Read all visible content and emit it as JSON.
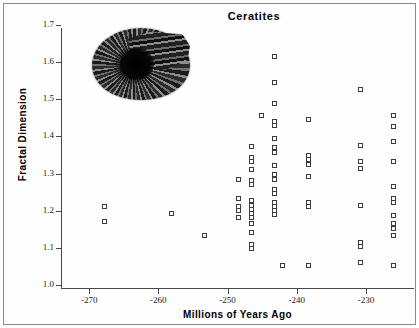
{
  "chart_data": {
    "type": "scatter",
    "title": "Ceratites",
    "xlabel": "Millions of Years Ago",
    "ylabel": "Fractal Dimension",
    "xlim": [
      -274.5,
      -223.5
    ],
    "ylim": [
      1.0,
      1.7
    ],
    "xticks": [
      -270,
      -260,
      -250,
      -240,
      -230
    ],
    "xtick_labels": [
      "-270",
      "-260",
      "-250",
      "-240",
      "-230"
    ],
    "yticks": [
      1.0,
      1.1,
      1.2,
      1.3,
      1.4,
      1.5,
      1.6,
      1.7
    ],
    "ytick_labels": [
      "1.0",
      "1.1",
      "1.2",
      "1.3",
      "1.4",
      "1.5",
      "1.6",
      "1.7"
    ],
    "grid": false,
    "legend": null,
    "marker": "open-square",
    "marker_color": "#3b3b3b",
    "series_name": "Ceratites specimens",
    "points": [
      {
        "x": -267.7,
        "y": 1.211
      },
      {
        "x": -267.7,
        "y": 1.17
      },
      {
        "x": -258.0,
        "y": 1.192
      },
      {
        "x": -253.3,
        "y": 1.131
      },
      {
        "x": -248.3,
        "y": 1.283
      },
      {
        "x": -248.3,
        "y": 1.231
      },
      {
        "x": -248.3,
        "y": 1.209
      },
      {
        "x": -248.3,
        "y": 1.198
      },
      {
        "x": -248.3,
        "y": 1.181
      },
      {
        "x": -246.4,
        "y": 1.371
      },
      {
        "x": -246.4,
        "y": 1.343
      },
      {
        "x": -246.4,
        "y": 1.33
      },
      {
        "x": -246.4,
        "y": 1.31
      },
      {
        "x": -246.4,
        "y": 1.279
      },
      {
        "x": -246.4,
        "y": 1.268
      },
      {
        "x": -246.4,
        "y": 1.225
      },
      {
        "x": -246.4,
        "y": 1.214
      },
      {
        "x": -246.4,
        "y": 1.203
      },
      {
        "x": -246.4,
        "y": 1.192
      },
      {
        "x": -246.4,
        "y": 1.181
      },
      {
        "x": -246.4,
        "y": 1.164
      },
      {
        "x": -246.4,
        "y": 1.141
      },
      {
        "x": -246.4,
        "y": 1.108
      },
      {
        "x": -246.4,
        "y": 1.097
      },
      {
        "x": -245.0,
        "y": 1.455
      },
      {
        "x": -243.2,
        "y": 1.614
      },
      {
        "x": -243.2,
        "y": 1.544
      },
      {
        "x": -243.2,
        "y": 1.486
      },
      {
        "x": -243.2,
        "y": 1.44
      },
      {
        "x": -243.2,
        "y": 1.427
      },
      {
        "x": -243.2,
        "y": 1.394
      },
      {
        "x": -243.2,
        "y": 1.368
      },
      {
        "x": -243.2,
        "y": 1.355
      },
      {
        "x": -243.2,
        "y": 1.321
      },
      {
        "x": -243.2,
        "y": 1.295
      },
      {
        "x": -243.2,
        "y": 1.283
      },
      {
        "x": -243.2,
        "y": 1.256
      },
      {
        "x": -243.2,
        "y": 1.245
      },
      {
        "x": -243.2,
        "y": 1.221
      },
      {
        "x": -243.2,
        "y": 1.21
      },
      {
        "x": -243.2,
        "y": 1.199
      },
      {
        "x": -243.2,
        "y": 1.188
      },
      {
        "x": -242.0,
        "y": 1.052
      },
      {
        "x": -238.2,
        "y": 1.444
      },
      {
        "x": -238.2,
        "y": 1.348
      },
      {
        "x": -238.2,
        "y": 1.336
      },
      {
        "x": -238.2,
        "y": 1.322
      },
      {
        "x": -238.2,
        "y": 1.292
      },
      {
        "x": -238.2,
        "y": 1.221
      },
      {
        "x": -238.2,
        "y": 1.21
      },
      {
        "x": -238.2,
        "y": 1.052
      },
      {
        "x": -230.7,
        "y": 1.524
      },
      {
        "x": -230.7,
        "y": 1.373
      },
      {
        "x": -230.7,
        "y": 1.332
      },
      {
        "x": -230.7,
        "y": 1.311
      },
      {
        "x": -230.7,
        "y": 1.213
      },
      {
        "x": -230.7,
        "y": 1.112
      },
      {
        "x": -230.7,
        "y": 1.101
      },
      {
        "x": -230.7,
        "y": 1.06
      },
      {
        "x": -226.0,
        "y": 1.456
      },
      {
        "x": -226.0,
        "y": 1.425
      },
      {
        "x": -226.0,
        "y": 1.384
      },
      {
        "x": -226.0,
        "y": 1.332
      },
      {
        "x": -226.0,
        "y": 1.264
      },
      {
        "x": -226.0,
        "y": 1.232
      },
      {
        "x": -226.0,
        "y": 1.221
      },
      {
        "x": -226.0,
        "y": 1.186
      },
      {
        "x": -226.0,
        "y": 1.163
      },
      {
        "x": -226.0,
        "y": 1.152
      },
      {
        "x": -226.0,
        "y": 1.131
      },
      {
        "x": -226.0,
        "y": 1.052
      }
    ],
    "inset_image": {
      "name": "ceratites-ammonite-fossil-photo",
      "description": "Black-and-white photograph of a coiled ribbed ammonite fossil"
    }
  }
}
